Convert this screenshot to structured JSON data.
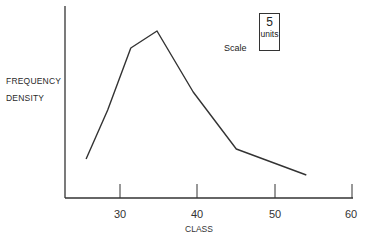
{
  "chart_data": {
    "type": "line",
    "title": "",
    "xlabel": "CLASS",
    "ylabel": "FREQUENCY DENSITY",
    "x_ticks": [
      30,
      40,
      50,
      60
    ],
    "xlim": [
      23,
      60
    ],
    "y_ticks": [],
    "grid": false,
    "legend": null,
    "annotation": {
      "label": "Scale",
      "box_value": "5",
      "box_unit": "units"
    },
    "series": [
      {
        "name": "frequency polygon",
        "x": [
          25.6,
          28.4,
          31.4,
          34.8,
          39.5,
          45.1,
          54.2
        ],
        "y_relative": [
          39,
          88,
          150,
          167,
          106,
          49,
          23
        ]
      }
    ]
  },
  "labels": {
    "ylabel_line1": "FREQUENCY",
    "ylabel_line2": "DENSITY",
    "xlabel": "CLASS",
    "ticks": [
      "30",
      "40",
      "50",
      "60"
    ],
    "scale_label": "Scale",
    "scale_value": "5",
    "scale_unit": "units"
  }
}
